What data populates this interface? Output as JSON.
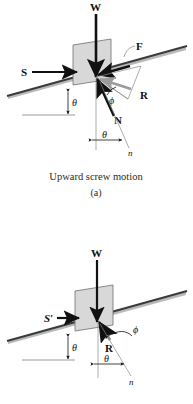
{
  "figure": {
    "title_a": "Upward screw motion",
    "panel_a_label": "(a)",
    "colors": {
      "block_fill": "#d8d8d8",
      "block_stroke": "#6f6f6f",
      "incline_line": "#3a3a3a",
      "incline_shadow": "#b9b9b9",
      "vector_dark": "#111111",
      "vector_gray": "#9a9a9a",
      "thin_line": "#8a8a8a",
      "text": "#111111",
      "caption": "#2b2b2b"
    }
  },
  "panel_a": {
    "name": "upward-screw-motion",
    "labels": {
      "weight": "W",
      "applied_force": "S",
      "friction_force": "F",
      "normal_force": "N",
      "resultant": "R",
      "incline_angle": "θ",
      "friction_angle": "ϕ",
      "normal_angle": "θ",
      "normal_axis": "n"
    }
  },
  "panel_b": {
    "name": "downward-screw-motion",
    "labels": {
      "weight": "W",
      "applied_force": "S′",
      "resultant": "R",
      "incline_angle": "θ",
      "friction_angle": "ϕ",
      "normal_angle": "θ",
      "normal_axis": "n"
    }
  }
}
